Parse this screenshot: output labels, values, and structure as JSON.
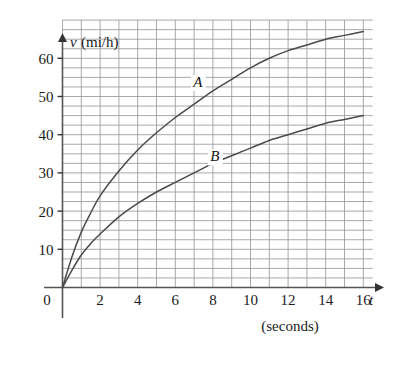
{
  "chart_data": {
    "type": "line",
    "title": "",
    "xlabel": "t",
    "xlabel_units": "(seconds)",
    "ylabel": "v",
    "ylabel_units": "(mi/h)",
    "xlim": [
      0,
      17
    ],
    "ylim": [
      0,
      70
    ],
    "xticks": [
      0,
      2,
      4,
      6,
      8,
      10,
      12,
      14,
      16
    ],
    "xtick_labels": [
      "0",
      "2",
      "4",
      "6",
      "8",
      "10",
      "12",
      "14",
      "16"
    ],
    "yticks": [
      10,
      20,
      30,
      40,
      50,
      60
    ],
    "ytick_labels": [
      "10",
      "20",
      "30",
      "40",
      "50",
      "60"
    ],
    "grid": true,
    "grid_x_step": 1,
    "grid_y_step": 2.5,
    "legend": "inline-labels",
    "axis_color": "#555555",
    "grid_color": "#9a9a9a",
    "curve_color": "#4a4a4a",
    "series": [
      {
        "name": "A",
        "label": "A",
        "label_x": 7.2,
        "label_y": 52.5,
        "x": [
          0,
          0.5,
          1,
          1.5,
          2,
          3,
          4,
          5,
          6,
          7,
          8,
          9,
          10,
          11,
          12,
          13,
          14,
          15,
          16
        ],
        "values": [
          0,
          8,
          14.5,
          19.5,
          24,
          30.5,
          36,
          40.5,
          44.5,
          48,
          51.5,
          54.5,
          57.5,
          60,
          62,
          63.5,
          65,
          66,
          67
        ]
      },
      {
        "name": "B",
        "label": "B",
        "label_x": 8.1,
        "label_y": 33,
        "x": [
          0,
          0.5,
          1,
          1.5,
          2,
          3,
          4,
          5,
          6,
          7,
          8,
          9,
          10,
          11,
          12,
          13,
          14,
          15,
          16
        ],
        "values": [
          0,
          4.5,
          8.5,
          11.5,
          14,
          18.5,
          22,
          25,
          27.5,
          30,
          32.5,
          34.5,
          36.5,
          38.5,
          40,
          41.5,
          43,
          44,
          45
        ]
      }
    ]
  }
}
